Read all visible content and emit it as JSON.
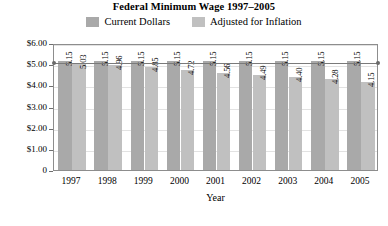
{
  "chart_data": {
    "type": "bar",
    "title": "Federal Minimum Wage 1997–2005",
    "xlabel": "Year",
    "ylabel": "Minimum Hourly Wage",
    "categories": [
      "1997",
      "1998",
      "1999",
      "2000",
      "2001",
      "2002",
      "2003",
      "2004",
      "2005"
    ],
    "series": [
      {
        "name": "Current Dollars",
        "color": "#a9a9a9",
        "values": [
          5.15,
          5.15,
          5.15,
          5.15,
          5.15,
          5.15,
          5.15,
          5.15,
          5.15
        ],
        "labels": [
          "5.15",
          "5.15",
          "5.15",
          "5.15",
          "5.15",
          "5.15",
          "5.15",
          "5.15",
          "5.15"
        ]
      },
      {
        "name": "Adjusted for Inflation",
        "color": "#c0c0c0",
        "values": [
          5.03,
          4.96,
          4.85,
          4.72,
          4.56,
          4.49,
          4.4,
          4.28,
          4.15
        ],
        "labels": [
          "5.03",
          "4.96",
          "4.85",
          "4.72",
          "4.56",
          "4.49",
          "4.40",
          "4.28",
          "4.15"
        ]
      }
    ],
    "ylim": [
      0,
      6
    ],
    "yticks": [
      {
        "value": 6,
        "label": "$6.00"
      },
      {
        "value": 5,
        "label": "$5.00"
      },
      {
        "value": 4,
        "label": "$4.00"
      },
      {
        "value": 3,
        "label": "$3.00"
      },
      {
        "value": 2,
        "label": "$2.00"
      },
      {
        "value": 1,
        "label": "$1.00"
      },
      {
        "value": 0,
        "label": "0"
      }
    ],
    "grid": true,
    "legend_position": "top",
    "reference_line": {
      "value": 5.15,
      "endpoint_markers": true
    }
  }
}
